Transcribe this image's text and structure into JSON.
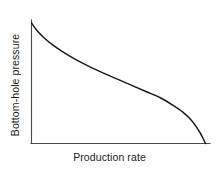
{
  "chart_data": {
    "type": "line",
    "title": "",
    "subtitle": "",
    "xlabel": "Production rate",
    "ylabel": "Bottom-hole pressure",
    "grid": false,
    "legend": null,
    "legend_position": "none",
    "xlim": [
      0,
      1
    ],
    "ylim": [
      0,
      1
    ],
    "axis_ticks": {
      "x": [],
      "y": []
    },
    "annotations": [],
    "series": [
      {
        "name": "Inflow performance relationship",
        "color": "#1a1a1a",
        "x": [
          0.0,
          0.03,
          0.07,
          0.12,
          0.18,
          0.25,
          0.33,
          0.42,
          0.5,
          0.58,
          0.66,
          0.74,
          0.81,
          0.87,
          0.92,
          0.96,
          0.98,
          1.0
        ],
        "y": [
          1.0,
          0.94,
          0.88,
          0.82,
          0.76,
          0.7,
          0.64,
          0.58,
          0.53,
          0.48,
          0.43,
          0.38,
          0.32,
          0.26,
          0.19,
          0.11,
          0.06,
          0.0
        ]
      }
    ]
  },
  "labels": {
    "x_axis": "Production rate",
    "y_axis": "Bottom-hole pressure"
  },
  "colors": {
    "curve": "#1a1a1a",
    "axis": "#4a4a4a",
    "background": "#ffffff",
    "text": "#1a1a1a"
  }
}
